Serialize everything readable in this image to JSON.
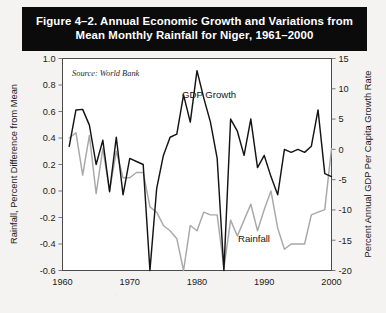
{
  "figure": {
    "title_line1": "Figure 4–2. Annual Economic Growth and Variations from",
    "title_line2": "Mean Monthly Rainfall for Niger, 1961–2000",
    "title_full": "Figure 4–2. Annual Economic Growth and Variations from Mean Monthly Rainfall for Niger, 1961–2000",
    "title_bar_color": "#0b0b0b",
    "title_text_color": "#ffffff",
    "page_background": "#f4f3f1"
  },
  "chart_data": {
    "type": "line",
    "title": "Figure 4–2. Annual Economic Growth and Variations from Mean Monthly Rainfall for Niger, 1961–2000",
    "source_note": "Source: World Bank",
    "xlabel": "",
    "x": [
      1961,
      1962,
      1963,
      1964,
      1965,
      1966,
      1967,
      1968,
      1969,
      1970,
      1971,
      1972,
      1973,
      1974,
      1975,
      1976,
      1977,
      1978,
      1979,
      1980,
      1981,
      1982,
      1983,
      1984,
      1985,
      1986,
      1987,
      1988,
      1989,
      1990,
      1991,
      1992,
      1993,
      1994,
      1995,
      1996,
      1997,
      1998,
      1999,
      2000
    ],
    "xlim": [
      1960,
      2000
    ],
    "xticks": [
      1960,
      1970,
      1980,
      1990,
      2000
    ],
    "xticklabels": [
      "1960",
      "1970",
      "1980",
      "1990",
      "2000"
    ],
    "grid": false,
    "legend": "inline-annotations",
    "annotations": [
      {
        "text": "GDP Growth",
        "x": 1979,
        "y_axis": "right",
        "note": "label above black line peak"
      },
      {
        "text": "Rainfall",
        "x": 1987,
        "y_axis": "left",
        "note": "label beside gray line"
      },
      {
        "text": "Source: World Bank",
        "x": 1962,
        "y_axis": "left",
        "note": "italic note top-left inside plot"
      }
    ],
    "axes": {
      "left": {
        "ylabel": "Rainfall, Percent Difference from Mean",
        "ylim": [
          -0.6,
          1.0
        ],
        "yticks": [
          -0.6,
          -0.4,
          -0.2,
          0.0,
          0.2,
          0.4,
          0.6,
          0.8,
          1.0
        ],
        "yticklabels": [
          "-0.6",
          "-0.4",
          "-0.2",
          "0.0",
          "0.2",
          "0.4",
          "0.6",
          "0.8",
          "1.0"
        ],
        "series": "Rainfall"
      },
      "right": {
        "ylabel": "Percent Annual GDP Per Capita Growth Rate",
        "ylim": [
          -20,
          15
        ],
        "yticks": [
          -20,
          -15,
          -10,
          -5,
          0,
          5,
          10,
          15
        ],
        "yticklabels": [
          "-20",
          "-15",
          "-10",
          "-5",
          "0",
          "5",
          "10",
          "15"
        ],
        "series": "GDP Growth"
      }
    },
    "series": [
      {
        "name": "GDP Growth",
        "axis": "right",
        "color": "#141414",
        "units": "percent annual GDP per capita growth rate",
        "values": [
          0.5,
          6.5,
          6.6,
          4.0,
          -2.5,
          1.5,
          -7.0,
          2.0,
          -7.5,
          -1.5,
          -2.0,
          -2.5,
          -20.0,
          -6.5,
          -1.0,
          2.0,
          2.5,
          9.0,
          4.5,
          13.0,
          8.5,
          4.5,
          -1.5,
          -20.0,
          5.0,
          3.0,
          -1.0,
          5.0,
          -3.0,
          -1.0,
          -4.5,
          -7.5,
          0.0,
          -0.5,
          0.0,
          -0.5,
          0.5,
          6.5,
          -4.0,
          -4.5
        ]
      },
      {
        "name": "Rainfall",
        "axis": "left",
        "color": "#a8a8a8",
        "units": "percent difference from mean monthly rainfall",
        "values": [
          0.4,
          0.44,
          0.12,
          0.42,
          -0.02,
          0.32,
          0.0,
          0.3,
          0.1,
          0.1,
          0.14,
          0.14,
          -0.12,
          -0.16,
          -0.26,
          -0.3,
          -0.36,
          -0.6,
          -0.26,
          -0.3,
          -0.16,
          -0.18,
          -0.18,
          -0.58,
          -0.22,
          -0.34,
          -0.22,
          -0.1,
          -0.3,
          -0.14,
          0.0,
          -0.28,
          -0.44,
          -0.4,
          -0.4,
          -0.4,
          -0.18,
          -0.16,
          -0.14,
          0.32
        ]
      }
    ]
  },
  "labels": {
    "source": "Source: World Bank",
    "gdp_series": "GDP Growth",
    "rainfall_series": "Rainfall",
    "left_axis_title": "Rainfall, Percent Difference from Mean",
    "right_axis_title": "Percent Annual GDP Per Capita Growth Rate"
  }
}
